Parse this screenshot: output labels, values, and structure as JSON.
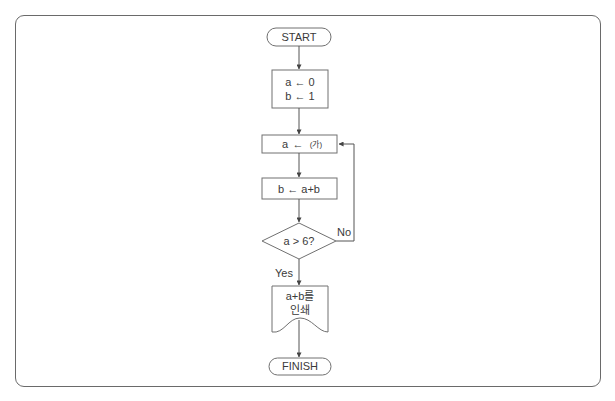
{
  "diagram": {
    "type": "flowchart",
    "nodes": {
      "start": {
        "kind": "terminal",
        "label": "START"
      },
      "init": {
        "kind": "process",
        "lines": [
          "a  ←  0",
          "b  ←  1"
        ]
      },
      "assign_a": {
        "kind": "process",
        "var": "a",
        "arrow": "←",
        "value": "(가)"
      },
      "assign_b": {
        "kind": "process",
        "label": "b  ←  a+b"
      },
      "decision": {
        "kind": "decision",
        "label": "a > 6?"
      },
      "print": {
        "kind": "document",
        "lines": [
          "a+b를",
          "인쇄"
        ]
      },
      "finish": {
        "kind": "terminal",
        "label": "FINISH"
      }
    },
    "edges": [
      {
        "from": "start",
        "to": "init"
      },
      {
        "from": "init",
        "to": "assign_a"
      },
      {
        "from": "assign_a",
        "to": "assign_b"
      },
      {
        "from": "assign_b",
        "to": "decision"
      },
      {
        "from": "decision",
        "to": "assign_a",
        "label": "No"
      },
      {
        "from": "decision",
        "to": "print",
        "label": "Yes"
      },
      {
        "from": "print",
        "to": "finish"
      }
    ],
    "branch_labels": {
      "no": "No",
      "yes": "Yes"
    }
  },
  "colors": {
    "line": "#555555",
    "border": "#707070",
    "text": "#3a3a3a",
    "background": "#ffffff"
  }
}
